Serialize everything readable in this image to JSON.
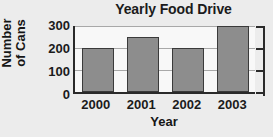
{
  "chart_data": {
    "type": "bar",
    "title": "Yearly Food Drive",
    "xlabel": "Year",
    "ylabel": "Number of Cans",
    "ylabel_lines": [
      "Number",
      "of Cans"
    ],
    "categories": [
      "2000",
      "2001",
      "2002",
      "2003"
    ],
    "values": [
      200,
      250,
      200,
      300
    ],
    "ylim": [
      0,
      300
    ],
    "yticks": [
      0,
      100,
      200,
      300
    ],
    "ytick_labels": [
      "0",
      "100",
      "200",
      "300"
    ],
    "grid": true,
    "legend": false,
    "colors": {
      "bar_fill": "#8d8d8d",
      "bar_stroke": "#3a3a3a",
      "axis": "#2a2a2a",
      "gridline": "#a8a8a8",
      "plot_background": "#f8f8f8",
      "page_background": "#ececec",
      "text": "#1b1b1b"
    }
  }
}
